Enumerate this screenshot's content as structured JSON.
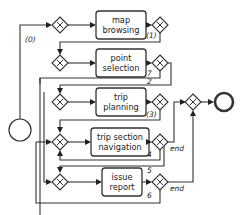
{
  "diagram": {
    "type": "bpmn-process",
    "start_event": {
      "name": "start"
    },
    "end_event": {
      "name": "end"
    },
    "tasks": [
      {
        "id": "map-browsing",
        "lines": [
          "map",
          "browsing"
        ]
      },
      {
        "id": "point-selection",
        "lines": [
          "point",
          "selection"
        ]
      },
      {
        "id": "trip-planning",
        "lines": [
          "trip",
          "planning"
        ]
      },
      {
        "id": "trip-section-navigation",
        "lines": [
          "trip section",
          "navigation"
        ]
      },
      {
        "id": "issue-report",
        "lines": [
          "issue",
          "report"
        ]
      }
    ],
    "flow_labels": {
      "start_to_map": "(0)",
      "map_to_point": "(1)",
      "point_to_point": "7",
      "point_to_trip": "2",
      "trip_to_nav": "(3)",
      "nav_end": "end",
      "nav_to_nav": "4",
      "nav_to_issue": "5",
      "issue_end": "end",
      "issue_to_nav": "6"
    },
    "gateway_type": "exclusive",
    "edges": [
      {
        "from": "start",
        "to": "map-browsing",
        "label": "(0)"
      },
      {
        "from": "map-browsing",
        "to": "point-selection",
        "label": "(1)"
      },
      {
        "from": "point-selection",
        "to": "point-selection",
        "label": "7"
      },
      {
        "from": "point-selection",
        "to": "trip-planning",
        "label": "2"
      },
      {
        "from": "trip-planning",
        "to": "trip-section-navigation",
        "label": "(3)"
      },
      {
        "from": "trip-section-navigation",
        "to": "end",
        "label": "end"
      },
      {
        "from": "trip-section-navigation",
        "to": "trip-section-navigation",
        "label": "4"
      },
      {
        "from": "trip-section-navigation",
        "to": "issue-report",
        "label": "5"
      },
      {
        "from": "issue-report",
        "to": "end",
        "label": "end"
      },
      {
        "from": "issue-report",
        "to": "trip-section-navigation",
        "label": "6"
      }
    ]
  }
}
